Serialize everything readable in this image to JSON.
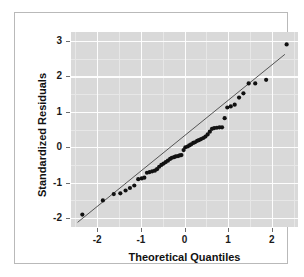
{
  "chart_data": {
    "type": "scatter",
    "title": "",
    "xlabel": "Theoretical Quantiles",
    "ylabel": "Standardized Residuals",
    "xlim": [
      -2.6,
      2.6
    ],
    "ylim": [
      -2.25,
      3.25
    ],
    "xticks": [
      -2,
      -1,
      0,
      1,
      2
    ],
    "xticklabels": [
      "-2",
      "-1",
      "0",
      "1",
      "2"
    ],
    "yticks": [
      -2,
      -1,
      0,
      1,
      2,
      3
    ],
    "yticklabels": [
      "-2",
      "-1",
      "0",
      "1",
      "2",
      "3"
    ],
    "grid": true,
    "grid_minor": true,
    "legend": "none",
    "panel_background": "#d9d9d9",
    "grid_color": "#ffffff",
    "point_color": "#111111",
    "line_color": "#555555",
    "series": [
      {
        "name": "Standardized residuals",
        "marker": "filled-circle",
        "x": [
          -2.34,
          -1.87,
          -1.62,
          -1.47,
          -1.35,
          -1.25,
          -1.15,
          -1.06,
          -0.98,
          -0.92,
          -0.86,
          -0.8,
          -0.74,
          -0.68,
          -0.63,
          -0.58,
          -0.53,
          -0.48,
          -0.43,
          -0.38,
          -0.33,
          -0.29,
          -0.24,
          -0.2,
          -0.15,
          -0.11,
          -0.07,
          -0.02,
          0.02,
          0.07,
          0.11,
          0.15,
          0.2,
          0.24,
          0.29,
          0.33,
          0.38,
          0.43,
          0.48,
          0.53,
          0.58,
          0.63,
          0.68,
          0.74,
          0.8,
          0.86,
          0.92,
          0.98,
          1.06,
          1.15,
          1.25,
          1.35,
          1.47,
          1.62,
          1.87,
          2.34
        ],
        "y": [
          -1.9,
          -1.5,
          -1.32,
          -1.3,
          -1.22,
          -1.15,
          -1.08,
          -0.9,
          -0.88,
          -0.86,
          -0.72,
          -0.7,
          -0.68,
          -0.66,
          -0.62,
          -0.55,
          -0.5,
          -0.46,
          -0.42,
          -0.38,
          -0.33,
          -0.3,
          -0.28,
          -0.26,
          -0.25,
          -0.23,
          -0.22,
          -0.08,
          0.0,
          0.02,
          0.05,
          0.08,
          0.12,
          0.14,
          0.18,
          0.2,
          0.23,
          0.26,
          0.3,
          0.36,
          0.44,
          0.52,
          0.54,
          0.55,
          0.56,
          0.56,
          0.82,
          1.12,
          1.15,
          1.2,
          1.4,
          1.52,
          1.8,
          1.8,
          1.9,
          2.9
        ]
      }
    ],
    "reference_line": {
      "description": "qq reference line",
      "x": [
        -2.45,
        2.3
      ],
      "y": [
        -2.12,
        2.62
      ]
    }
  }
}
